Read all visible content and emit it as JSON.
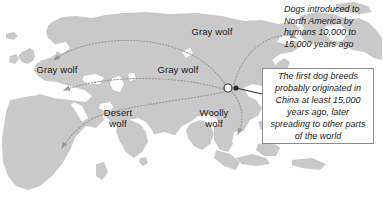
{
  "figure": {
    "type": "map",
    "background_color": "#ffffff",
    "land_color": "#c9c9c9",
    "land_shadow_color": "#b0b0b0",
    "water_color": "#ffffff",
    "arrow_color": "#9a9a9a",
    "text_color": "#1c1c1c",
    "box_border_color": "#8e8e8e"
  },
  "map_labels": [
    {
      "id": "gray-wolf-europe",
      "text": "Gray wolf"
    },
    {
      "id": "gray-wolf-north",
      "text": "Gray wolf"
    },
    {
      "id": "gray-wolf-center",
      "text": "Gray wolf"
    },
    {
      "id": "desert-wolf",
      "text": "Desert\nwolf"
    },
    {
      "id": "woolly-wolf",
      "text": "Woolly\nwolf"
    }
  ],
  "annotations": {
    "north_america": "Dogs introduced to\nNorth America by\nhumans 10,000 to\n15,000 years ago",
    "origin_callout": "The first dog breeds probably originated in China at least 15,000 years ago, later spreading to other parts of the world"
  },
  "origin_marker": {
    "label": "China origin point",
    "x": 228,
    "y": 88
  },
  "migration_routes": [
    {
      "from": "China",
      "to": "Northern Europe",
      "label": "Gray wolf"
    },
    {
      "from": "China",
      "to": "Western Europe",
      "label": "Gray wolf"
    },
    {
      "from": "China",
      "to": "Africa",
      "label": "Desert wolf"
    },
    {
      "from": "China",
      "to": "Southeast Asia",
      "label": "Woolly wolf"
    },
    {
      "from": "China",
      "to": "North America",
      "label": "Dogs introduced to North America"
    }
  ]
}
